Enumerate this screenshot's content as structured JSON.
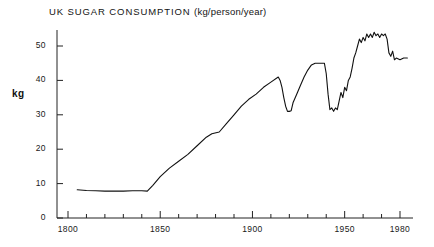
{
  "chart_data": {
    "type": "line",
    "title": "UK SUGAR CONSUMPTION  (kg/person/year)",
    "title_main": "UK SUGAR CONSUMPTION",
    "title_units": "(kg/person/year)",
    "xlabel": "",
    "ylabel": "kg",
    "xlim": [
      1800,
      1986
    ],
    "ylim": [
      0,
      55
    ],
    "grid": false,
    "legend": null,
    "line_color": "#111111",
    "axis_color": "#222222",
    "background_color": "#ffffff",
    "y_ticks": [
      0,
      10,
      20,
      30,
      40,
      50
    ],
    "y_tick_labels": [
      "0",
      "10",
      "20",
      "30",
      "40",
      "50"
    ],
    "y_minor_step": 10,
    "x_ticks": [
      1800,
      1810,
      1820,
      1830,
      1840,
      1850,
      1860,
      1870,
      1880,
      1890,
      1900,
      1910,
      1920,
      1930,
      1940,
      1950,
      1960,
      1970,
      1980
    ],
    "x_tick_labels_major": [
      "1800",
      "1850",
      "1900",
      "1950",
      "1980"
    ],
    "x_major_ticks": [
      1800,
      1850,
      1900,
      1950,
      1980
    ],
    "series_name": "UK sugar consumption",
    "x": [
      1805,
      1810,
      1815,
      1820,
      1825,
      1830,
      1835,
      1840,
      1843,
      1846,
      1850,
      1855,
      1860,
      1865,
      1870,
      1875,
      1878,
      1882,
      1886,
      1890,
      1894,
      1898,
      1902,
      1906,
      1910,
      1914,
      1915,
      1916,
      1917,
      1918,
      1919,
      1920,
      1921,
      1922,
      1924,
      1926,
      1928,
      1930,
      1932,
      1934,
      1936,
      1938,
      1939,
      1940,
      1941,
      1942,
      1943,
      1944,
      1945,
      1946,
      1947,
      1948,
      1949,
      1950,
      1951,
      1952,
      1953,
      1954,
      1955,
      1956,
      1957,
      1958,
      1959,
      1960,
      1961,
      1962,
      1963,
      1964,
      1965,
      1966,
      1967,
      1968,
      1969,
      1970,
      1971,
      1972,
      1973,
      1974,
      1975,
      1976,
      1977,
      1978,
      1980,
      1982,
      1984
    ],
    "y": [
      8.2,
      8.0,
      7.9,
      7.8,
      7.8,
      7.8,
      7.9,
      7.9,
      7.8,
      9.5,
      12.0,
      14.5,
      16.5,
      18.5,
      21.0,
      23.5,
      24.5,
      25.0,
      27.5,
      30.0,
      32.5,
      34.5,
      36.0,
      38.0,
      39.5,
      41.0,
      40.0,
      38.0,
      35.0,
      32.5,
      31.0,
      31.0,
      31.2,
      33.5,
      36.0,
      38.5,
      41.0,
      43.0,
      44.5,
      45.0,
      45.0,
      45.0,
      45.0,
      42.0,
      36.0,
      31.5,
      32.0,
      31.0,
      32.0,
      31.5,
      34.0,
      36.5,
      35.0,
      38.0,
      37.0,
      40.0,
      41.0,
      43.5,
      46.5,
      48.0,
      50.0,
      52.0,
      51.0,
      52.5,
      51.5,
      53.5,
      52.5,
      53.5,
      52.5,
      54.0,
      53.0,
      53.5,
      52.5,
      53.5,
      53.0,
      53.5,
      52.0,
      48.0,
      47.0,
      48.5,
      46.0,
      46.5,
      46.0,
      46.5,
      46.5
    ]
  }
}
